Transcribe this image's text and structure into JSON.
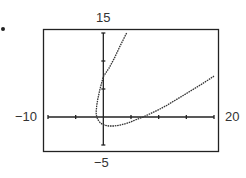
{
  "chart_data": {
    "type": "line",
    "title": "",
    "xlabel": "",
    "ylabel": "",
    "window": {
      "xmin": -10,
      "xmax": 20,
      "ymin": -5,
      "ymax": 15,
      "xscl": 5,
      "yscl": 5
    },
    "xlim": [
      -10,
      20
    ],
    "ylim": [
      -5,
      15
    ],
    "grid": false,
    "legend": null,
    "tick_labels": {
      "xmin": "−10",
      "xmax": "20",
      "ymin": "−5",
      "ymax": "15"
    },
    "series": [
      {
        "name": "curve",
        "style": "dotted-pixel",
        "points": [
          [
            4.2,
            15
          ],
          [
            3.0,
            12.6
          ],
          [
            2.0,
            10.5
          ],
          [
            1.0,
            8.7
          ],
          [
            0.0,
            7.2
          ],
          [
            -0.6,
            5.0
          ],
          [
            -1.0,
            3.2
          ],
          [
            -1.2,
            2.0
          ],
          [
            -1.3,
            0.8
          ],
          [
            -1.2,
            0.0
          ],
          [
            -0.9,
            -0.6
          ],
          [
            -0.5,
            -1.1
          ],
          [
            0.2,
            -1.45
          ],
          [
            1.0,
            -1.6
          ],
          [
            2.0,
            -1.6
          ],
          [
            3.0,
            -1.45
          ],
          [
            4.0,
            -1.2
          ],
          [
            5.0,
            -0.85
          ],
          [
            6.0,
            -0.45
          ],
          [
            7.2,
            0.0
          ],
          [
            8.5,
            0.6
          ],
          [
            10.0,
            1.3
          ],
          [
            11.5,
            2.1
          ],
          [
            13.0,
            3.0
          ],
          [
            14.5,
            3.9
          ],
          [
            16.0,
            4.8
          ],
          [
            18.0,
            6.0
          ],
          [
            20.0,
            7.3
          ]
        ]
      }
    ]
  },
  "labels": {
    "ymax": "15",
    "ymin": "−5",
    "xmin": "−10",
    "xmax": "20"
  },
  "colors": {
    "ink": "#222222",
    "background": "#ffffff"
  }
}
